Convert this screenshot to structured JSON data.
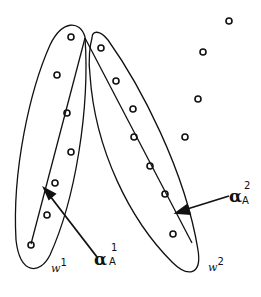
{
  "diagram": {
    "colors": {
      "stroke": "#111111",
      "background": "#ffffff"
    },
    "clusters": [
      {
        "name": "w1",
        "label": "w",
        "superscript": "1"
      },
      {
        "name": "w2",
        "label": "w",
        "superscript": "2"
      }
    ],
    "arrows": [
      {
        "symbol": "α",
        "superscript": "1",
        "subscript": "A"
      },
      {
        "symbol": "α",
        "superscript": "2",
        "subscript": "A"
      }
    ],
    "points": {
      "cluster_w1": [
        [
          71,
          37
        ],
        [
          57,
          75
        ],
        [
          67,
          113
        ],
        [
          71,
          152
        ],
        [
          55,
          183
        ],
        [
          47,
          215
        ],
        [
          31,
          245
        ]
      ],
      "cluster_w2": [
        [
          101,
          48
        ],
        [
          116,
          81
        ],
        [
          133,
          109
        ],
        [
          134,
          137
        ],
        [
          150,
          166
        ],
        [
          165,
          194
        ],
        [
          173,
          234
        ]
      ],
      "unclustered": [
        [
          229,
          21
        ],
        [
          203,
          52
        ],
        [
          198,
          99
        ],
        [
          185,
          137
        ]
      ]
    }
  }
}
